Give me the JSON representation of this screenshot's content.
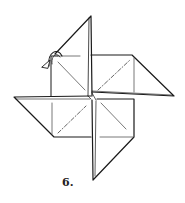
{
  "diagram": {
    "step_label": "6.",
    "colors": {
      "line": "#1a1a1a",
      "crease": "#555555",
      "background": "#ffffff"
    },
    "annotations": [
      {
        "type": "fold-arrow",
        "description": "curved arrow at upper-left indicating flap fold"
      },
      {
        "type": "valley-fold-line",
        "description": "dash-dot diagonal in top-right square"
      },
      {
        "type": "valley-fold-line",
        "description": "dash-dot diagonal in bottom-left square"
      }
    ]
  }
}
